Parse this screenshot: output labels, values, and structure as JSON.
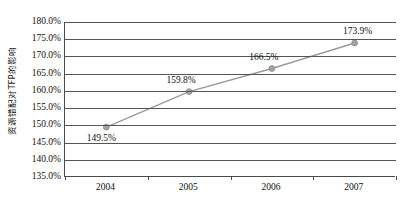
{
  "chart_data": {
    "type": "line",
    "title": "",
    "xlabel": "",
    "ylabel": "资源错配对TFP的影响",
    "categories": [
      "2004",
      "2005",
      "2006",
      "2007"
    ],
    "values": [
      149.5,
      159.8,
      166.5,
      173.9
    ],
    "point_labels": [
      "149.5%",
      "159.8%",
      "166.5%",
      "173.9%"
    ],
    "ylim": [
      135.0,
      180.0
    ],
    "ytick_values": [
      180.0,
      175.0,
      170.0,
      165.0,
      160.0,
      155.0,
      150.0,
      145.0,
      140.0,
      135.0
    ],
    "ytick_labels": [
      "180.0%",
      "175.0%",
      "170.0%",
      "165.0%",
      "160.0%",
      "155.0%",
      "150.0%",
      "145.0%",
      "140.0%",
      "135.0%"
    ],
    "grid": true,
    "legend": false,
    "series": [
      {
        "name": "资源错配对TFP的影响",
        "values": [
          149.5,
          159.8,
          166.5,
          173.9
        ],
        "color": "#999999",
        "marker": "circle",
        "marker_color": "#a0a0a0"
      }
    ],
    "colors": {
      "line": "#9a9a9a",
      "marker": "#a3a3a3",
      "grid": "#555555",
      "axis": "#4a4a4a",
      "text": "#111111",
      "background": "#ffffff"
    }
  }
}
